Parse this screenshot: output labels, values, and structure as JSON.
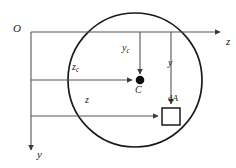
{
  "figure": {
    "background_color": "#ffffff",
    "stroke_color": "#1a1a1a",
    "line_color": "#555555",
    "width": 236,
    "height": 168
  },
  "axes": {
    "origin_label": "O",
    "horizontal_axis_label": "z",
    "vertical_axis_label": "y",
    "origin_point": {
      "x": 31,
      "y": 32
    },
    "horizontal_axis_tip": {
      "x": 222,
      "y": 32
    },
    "vertical_axis_tip": {
      "x": 31,
      "y": 152
    }
  },
  "shape": {
    "name": "circle-section",
    "center": {
      "x": 135,
      "y": 80
    },
    "radius": 67,
    "stroke_width": 1.6
  },
  "centroid": {
    "marker_label": "C",
    "point": {
      "x": 140,
      "y": 80
    },
    "dot_radius": 4.2,
    "vertical_distance_label": "y",
    "vertical_distance_subscript": "c",
    "horizontal_distance_label": "z",
    "horizontal_distance_subscript": "c"
  },
  "area_element": {
    "label_prefix": "d",
    "label_symbol": "A",
    "square": {
      "x": 162,
      "y": 108,
      "size": 18
    },
    "vertical_distance_label": "y",
    "horizontal_distance_label": "z"
  },
  "dimension_lines": {
    "yc": {
      "from": {
        "x": 140,
        "y": 32
      },
      "to": {
        "x": 140,
        "y": 76
      }
    },
    "zc": {
      "from": {
        "x": 31,
        "y": 80
      },
      "to": {
        "x": 134,
        "y": 80
      }
    },
    "y": {
      "from": {
        "x": 171,
        "y": 32
      },
      "to": {
        "x": 171,
        "y": 106
      }
    },
    "z": {
      "from": {
        "x": 31,
        "y": 116
      },
      "to": {
        "x": 160,
        "y": 116
      }
    }
  }
}
